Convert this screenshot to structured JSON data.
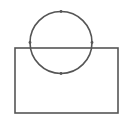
{
  "diagram": {
    "background": "#ffffff",
    "stroke_color": "#555555",
    "stroke_width": 1.6,
    "rectangle": {
      "x": 15,
      "y": 48,
      "width": 103,
      "height": 65
    },
    "circle": {
      "cx": 61,
      "cy": 42.5,
      "r": 31
    },
    "points": [
      {
        "name": "top",
        "x": 61,
        "y": 11.5
      },
      {
        "name": "left",
        "x": 30,
        "y": 42.5
      },
      {
        "name": "right",
        "x": 92,
        "y": 42.5
      },
      {
        "name": "bottom",
        "x": 61,
        "y": 73.5
      }
    ],
    "point_radius": 1.4
  }
}
